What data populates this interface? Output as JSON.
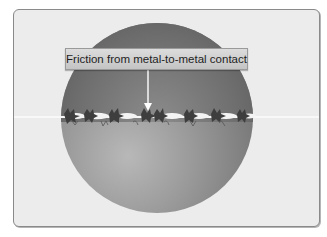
{
  "diagram": {
    "label": "Friction from metal-to-metal contact",
    "colors": {
      "panel_background": "#ececec",
      "panel_border": "#8a8a8a",
      "sphere_dark": "#5e5e5e",
      "sphere_light": "#b8b8b8",
      "contact_line": "#f8f8f8",
      "label_box": "#d0d0d0",
      "arrow": "#ffffff"
    },
    "elements": [
      "sphere",
      "contact-surface-line",
      "asperities",
      "callout-label",
      "callout-arrow"
    ]
  }
}
